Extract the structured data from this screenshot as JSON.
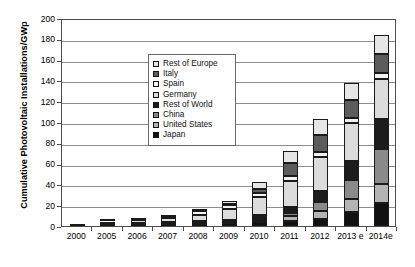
{
  "chart_data": {
    "type": "bar",
    "subtype": "stacked-bar",
    "title": "",
    "xlabel": "",
    "ylabel": "Cumulative Photovoltaic Installations/GWp",
    "ylim": [
      0,
      200
    ],
    "ytick_step": 20,
    "yticks": [
      "200",
      "180",
      "160",
      "140",
      "120",
      "100",
      "80",
      "60",
      "40",
      "20",
      "0"
    ],
    "grid": "horizontal",
    "legend_position": "upper-left-inside",
    "categories": [
      "2000",
      "2005",
      "2006",
      "2007",
      "2008",
      "2009",
      "2010",
      "2011",
      "2012",
      "2013 e",
      "2014e"
    ],
    "series": [
      {
        "name": "Japan",
        "swatch": "#111111",
        "pattern": "solid-black",
        "values": [
          0.3,
          1.4,
          1.7,
          1.9,
          2.1,
          2.6,
          3.6,
          4.9,
          6.6,
          13.6,
          22.5
        ]
      },
      {
        "name": "United States",
        "swatch": "#b4b4b4",
        "pattern": "light-grey",
        "values": [
          0.1,
          0.5,
          0.6,
          0.9,
          1.2,
          1.6,
          2.5,
          4.4,
          7.8,
          12.0,
          18.3
        ]
      },
      {
        "name": "China",
        "swatch": "#8a8a8a",
        "pattern": "mid-grey",
        "values": [
          0.0,
          0.1,
          0.1,
          0.1,
          0.2,
          0.3,
          0.9,
          3.3,
          8.3,
          18.3,
          33.0
        ]
      },
      {
        "name": "Rest of World",
        "swatch": "#1c1c1c",
        "pattern": "solid-black",
        "values": [
          0.1,
          0.3,
          0.4,
          0.6,
          1.0,
          1.7,
          3.4,
          6.1,
          11.0,
          19.0,
          29.5
        ]
      },
      {
        "name": "Germany",
        "swatch": "#dcdcdc",
        "pattern": "very-light-grey",
        "values": [
          0.1,
          2.0,
          2.9,
          4.2,
          6.2,
          10.6,
          17.6,
          25.0,
          32.6,
          35.7,
          38.5
        ]
      },
      {
        "name": "Spain",
        "swatch": "#f2f2f2",
        "pattern": "white",
        "values": [
          0.0,
          0.1,
          0.2,
          0.7,
          3.4,
          3.5,
          3.9,
          4.3,
          4.6,
          4.8,
          5.0
        ]
      },
      {
        "name": "Italy",
        "swatch": "#5c5c5c",
        "pattern": "dark-grey",
        "values": [
          0.0,
          0.1,
          0.1,
          0.1,
          0.5,
          1.2,
          3.5,
          12.8,
          16.4,
          17.6,
          18.5
        ]
      },
      {
        "name": "Rest of Europe",
        "swatch": "#e6e6e6",
        "pattern": "pale-grey",
        "values": [
          0.1,
          0.3,
          0.4,
          0.6,
          1.2,
          2.7,
          6.8,
          11.0,
          15.6,
          17.0,
          18.0
        ]
      }
    ],
    "totals": [
      0.7,
      4.8,
      6.4,
      9.1,
      15.8,
      24.2,
      42.2,
      71.8,
      103.0,
      138.0,
      183.3
    ]
  },
  "legend": {
    "items": [
      {
        "label": "Rest of Europe"
      },
      {
        "label": "Italy"
      },
      {
        "label": "Spain"
      },
      {
        "label": "Germany"
      },
      {
        "label": "Rest of World"
      },
      {
        "label": "China"
      },
      {
        "label": "United States"
      },
      {
        "label": "Japan"
      }
    ]
  },
  "axes": {
    "y_title": "Cumulative Photovoltaic Installations/GWp"
  }
}
